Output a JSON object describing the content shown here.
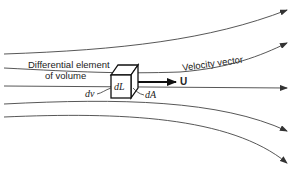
{
  "diagram": {
    "labels": {
      "element_line1": "Differential element",
      "element_line2": "of volume",
      "velocity_vector": "Velocity vector",
      "u": "U",
      "dL": "dL",
      "dA": "dA",
      "dv": "dv"
    },
    "colors": {
      "stroke": "#333333",
      "text": "#222222",
      "background": "#ffffff"
    },
    "streamlines": [
      {
        "name": "streamline-1",
        "start_y": 54,
        "end": [
          287,
          10
        ]
      },
      {
        "name": "streamline-2",
        "start_y": 68,
        "end": [
          287,
          43
        ]
      },
      {
        "name": "streamline-3",
        "start_y": 86,
        "end": [
          287,
          88
        ]
      },
      {
        "name": "streamline-4",
        "start_y": 104,
        "end": [
          287,
          131
        ]
      },
      {
        "name": "streamline-5",
        "start_y": 117,
        "end": [
          287,
          163
        ]
      }
    ]
  }
}
